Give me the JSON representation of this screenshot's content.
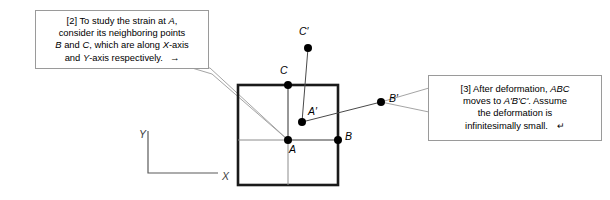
{
  "figure": {
    "background_color": "#ffffff",
    "ink_color": "#000000",
    "grid_color": "#8c8c8c",
    "axis_color": "#5a5a5a",
    "callout_border_color": "#9a9a9a"
  },
  "callouts": [
    {
      "id": "callout-left",
      "tag": "[2]",
      "line1_pre": "[2] To study the strain at ",
      "line1_var": "A",
      "line1_post": ",",
      "line2": "consider its neighboring points",
      "line3_pre": "",
      "line3_b": "B",
      "line3_mid": " and ",
      "line3_c": "C",
      "line3_post": ", which are along ",
      "line3_x": "X",
      "line3_tail": "-axis",
      "line4_pre": "and ",
      "line4_y": "Y",
      "line4_post": "-axis respectively.",
      "end_glyph": "→",
      "points_to": "A"
    },
    {
      "id": "callout-right",
      "tag": "[3]",
      "line1_pre": "[3] After deformation, ",
      "line1_var": "ABC",
      "line2_pre": "moves to ",
      "line2_var": "A'B'C'",
      "line2_post": ". Assume",
      "line3": "the deformation is",
      "line4": "infinitesimally small.",
      "end_glyph": "↵",
      "points_to": "B'"
    }
  ],
  "axes": {
    "x_label": "X",
    "y_label": "Y",
    "origin": [
      148,
      173
    ],
    "x_end": [
      218,
      173
    ],
    "y_end": [
      148,
      131
    ]
  },
  "square": {
    "left": 238,
    "top": 85,
    "right": 338,
    "bottom": 185,
    "has_center_gridlines": true
  },
  "points": [
    {
      "name": "A",
      "label": "A",
      "x": 288,
      "y": 140,
      "label_x": 289,
      "label_y": 143,
      "primed": false
    },
    {
      "name": "B",
      "label": "B",
      "x": 338,
      "y": 140,
      "label_x": 345,
      "label_y": 130,
      "primed": false
    },
    {
      "name": "C",
      "label": "C",
      "x": 288,
      "y": 85,
      "label_x": 280,
      "label_y": 64,
      "primed": false
    },
    {
      "name": "A'",
      "label": "A′",
      "x": 302,
      "y": 122,
      "label_x": 308,
      "label_y": 105,
      "primed": true
    },
    {
      "name": "B'",
      "label": "B′",
      "x": 381,
      "y": 102,
      "label_x": 389,
      "label_y": 92,
      "primed": true
    },
    {
      "name": "C'",
      "label": "C′",
      "x": 308,
      "y": 48,
      "label_x": 299,
      "label_y": 25,
      "primed": true
    }
  ],
  "deformed_edges": [
    {
      "from": "A'",
      "to": "B'"
    },
    {
      "from": "A'",
      "to": "C'"
    }
  ],
  "original_edges": [
    {
      "from": "A",
      "to": "B"
    },
    {
      "from": "A",
      "to": "C"
    }
  ]
}
